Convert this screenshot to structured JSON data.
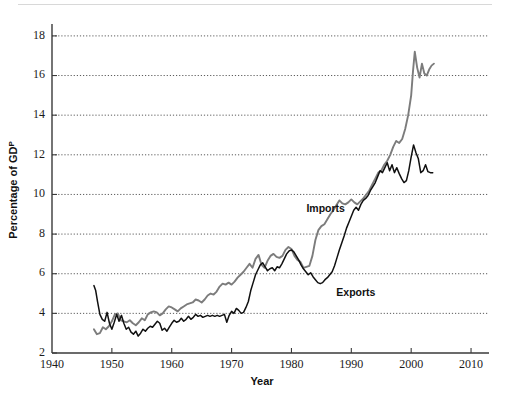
{
  "chart_data": {
    "type": "line",
    "title": "",
    "subtitle": "",
    "xlabel": "Year",
    "ylabel": "Percentage of GDP",
    "xlim": [
      1940,
      2013
    ],
    "ylim": [
      2,
      18.6
    ],
    "xticks": [
      1940,
      1950,
      1960,
      1970,
      1980,
      1990,
      2000,
      2010
    ],
    "yticks": [
      2,
      4,
      6,
      8,
      10,
      12,
      14,
      16,
      18
    ],
    "grid": "horizontal-dotted",
    "legend_position": "inline-annotations",
    "annotations": [
      {
        "text": "Imports",
        "x": 1982.5,
        "y": 9.1
      },
      {
        "text": "Exports",
        "x": 1987.5,
        "y": 4.9
      }
    ],
    "series": [
      {
        "name": "Imports",
        "color": "#7c7c7c",
        "x": [
          1947.0,
          1947.5,
          1948.0,
          1948.5,
          1949.0,
          1949.5,
          1950.0,
          1950.5,
          1951.0,
          1951.5,
          1952.0,
          1952.5,
          1953.0,
          1953.5,
          1954.0,
          1954.5,
          1955.0,
          1955.5,
          1956.0,
          1956.5,
          1957.0,
          1957.5,
          1958.0,
          1958.5,
          1959.0,
          1959.5,
          1960.0,
          1960.5,
          1961.0,
          1961.5,
          1962.0,
          1962.5,
          1963.0,
          1963.5,
          1964.0,
          1964.5,
          1965.0,
          1965.5,
          1966.0,
          1966.5,
          1967.0,
          1967.5,
          1968.0,
          1968.5,
          1969.0,
          1969.5,
          1970.0,
          1970.5,
          1971.0,
          1971.5,
          1972.0,
          1972.5,
          1973.0,
          1973.5,
          1974.0,
          1974.5,
          1975.0,
          1975.5,
          1976.0,
          1976.5,
          1977.0,
          1977.5,
          1978.0,
          1978.5,
          1979.0,
          1979.5,
          1980.0,
          1980.5,
          1981.0,
          1981.5,
          1982.0,
          1982.5,
          1983.0,
          1983.5,
          1984.0,
          1984.5,
          1985.0,
          1985.5,
          1986.0,
          1986.5,
          1987.0,
          1987.5,
          1988.0,
          1988.5,
          1989.0,
          1989.5,
          1990.0,
          1990.5,
          1991.0,
          1991.5,
          1992.0,
          1992.5,
          1993.0,
          1993.5,
          1994.0,
          1994.5,
          1995.0,
          1995.5,
          1996.0,
          1996.5,
          1997.0,
          1997.5,
          1998.0,
          1998.5,
          1999.0,
          1999.5,
          2000.0,
          2000.3,
          2000.6,
          2001.0,
          2001.4,
          2001.8,
          2002.2,
          2002.6,
          2003.0,
          2003.4,
          2003.8
        ],
        "y": [
          3.2,
          2.95,
          3.0,
          3.3,
          3.2,
          3.35,
          3.6,
          3.95,
          4.0,
          3.65,
          3.6,
          3.55,
          3.65,
          3.5,
          3.4,
          3.55,
          3.75,
          3.65,
          3.95,
          4.05,
          4.1,
          4.05,
          3.9,
          4.0,
          4.2,
          4.35,
          4.3,
          4.2,
          4.1,
          4.25,
          4.35,
          4.45,
          4.5,
          4.55,
          4.7,
          4.65,
          4.55,
          4.7,
          4.9,
          5.0,
          4.95,
          5.1,
          5.35,
          5.5,
          5.45,
          5.55,
          5.45,
          5.6,
          5.8,
          5.95,
          6.1,
          6.3,
          6.5,
          6.3,
          6.75,
          6.95,
          6.45,
          6.3,
          6.65,
          6.9,
          7.0,
          6.85,
          6.8,
          6.9,
          7.2,
          7.35,
          7.25,
          6.9,
          6.7,
          6.6,
          6.3,
          6.35,
          6.4,
          6.9,
          7.7,
          8.2,
          8.4,
          8.5,
          8.75,
          9.0,
          9.2,
          9.45,
          9.7,
          9.55,
          9.5,
          9.6,
          9.75,
          9.6,
          9.5,
          9.65,
          9.8,
          10.0,
          10.2,
          10.5,
          10.8,
          11.1,
          11.2,
          11.5,
          11.7,
          12.0,
          12.4,
          12.7,
          12.6,
          12.8,
          13.3,
          14.0,
          15.0,
          16.2,
          17.2,
          16.4,
          15.9,
          16.6,
          16.1,
          16.0,
          16.3,
          16.5,
          16.6
        ]
      },
      {
        "name": "Exports",
        "color": "#101010",
        "x": [
          1947.0,
          1947.3,
          1947.6,
          1948.0,
          1948.4,
          1948.8,
          1949.2,
          1949.6,
          1950.0,
          1950.4,
          1950.8,
          1951.2,
          1951.6,
          1952.0,
          1952.4,
          1952.8,
          1953.2,
          1953.6,
          1954.0,
          1954.4,
          1954.8,
          1955.2,
          1955.6,
          1956.0,
          1956.4,
          1956.8,
          1957.2,
          1957.6,
          1958.0,
          1958.4,
          1958.8,
          1959.2,
          1959.6,
          1960.0,
          1960.4,
          1960.8,
          1961.2,
          1961.6,
          1962.0,
          1962.4,
          1962.8,
          1963.2,
          1963.6,
          1964.0,
          1964.4,
          1964.8,
          1965.2,
          1965.6,
          1966.0,
          1966.4,
          1966.8,
          1967.2,
          1967.6,
          1968.0,
          1968.4,
          1968.8,
          1969.2,
          1969.6,
          1970.0,
          1970.4,
          1970.8,
          1971.2,
          1971.6,
          1972.0,
          1972.4,
          1972.8,
          1973.2,
          1973.6,
          1974.0,
          1974.4,
          1974.8,
          1975.2,
          1975.6,
          1976.0,
          1976.4,
          1976.8,
          1977.2,
          1977.6,
          1978.0,
          1978.4,
          1978.8,
          1979.2,
          1979.6,
          1980.0,
          1980.4,
          1980.8,
          1981.2,
          1981.6,
          1982.0,
          1982.4,
          1982.8,
          1983.2,
          1983.6,
          1984.0,
          1984.4,
          1984.8,
          1985.2,
          1985.6,
          1986.0,
          1986.4,
          1986.8,
          1987.2,
          1987.6,
          1988.0,
          1988.4,
          1988.8,
          1989.2,
          1989.6,
          1990.0,
          1990.4,
          1990.8,
          1991.2,
          1991.6,
          1992.0,
          1992.4,
          1992.8,
          1993.2,
          1993.6,
          1994.0,
          1994.4,
          1994.8,
          1995.2,
          1995.6,
          1996.0,
          1996.4,
          1996.8,
          1997.2,
          1997.6,
          1998.0,
          1998.4,
          1998.8,
          1999.2,
          1999.6,
          2000.0,
          2000.4,
          2000.8,
          2001.2,
          2001.6,
          2002.0,
          2002.4,
          2002.8,
          2003.2,
          2003.6
        ],
        "y": [
          5.4,
          5.15,
          4.6,
          3.95,
          3.7,
          3.6,
          4.05,
          3.5,
          3.2,
          3.55,
          3.95,
          3.6,
          3.9,
          3.5,
          3.2,
          3.3,
          3.05,
          2.95,
          3.1,
          2.85,
          3.0,
          3.2,
          3.1,
          3.25,
          3.35,
          3.3,
          3.45,
          3.6,
          3.5,
          3.15,
          3.25,
          3.1,
          3.3,
          3.5,
          3.65,
          3.55,
          3.6,
          3.75,
          3.6,
          3.7,
          3.85,
          3.7,
          3.8,
          3.95,
          3.85,
          3.9,
          3.8,
          3.85,
          3.9,
          3.85,
          3.9,
          3.85,
          3.9,
          3.85,
          3.9,
          3.95,
          3.55,
          3.9,
          4.1,
          4.0,
          4.25,
          4.15,
          4.0,
          4.05,
          4.3,
          4.6,
          5.15,
          5.55,
          5.95,
          6.2,
          6.45,
          6.55,
          6.35,
          6.15,
          6.25,
          6.3,
          6.15,
          6.35,
          6.3,
          6.5,
          6.75,
          7.0,
          7.15,
          7.2,
          7.1,
          6.9,
          6.7,
          6.45,
          6.25,
          6.1,
          5.95,
          6.05,
          5.85,
          5.7,
          5.55,
          5.5,
          5.55,
          5.7,
          5.8,
          5.95,
          6.1,
          6.4,
          6.8,
          7.2,
          7.55,
          7.9,
          8.3,
          8.6,
          8.9,
          9.2,
          9.35,
          9.2,
          9.5,
          9.7,
          9.8,
          9.95,
          10.2,
          10.4,
          10.6,
          10.9,
          11.2,
          11.1,
          11.35,
          11.6,
          11.2,
          11.5,
          11.1,
          11.35,
          11.05,
          10.8,
          10.6,
          10.7,
          11.2,
          11.9,
          12.5,
          12.1,
          11.8,
          11.1,
          11.2,
          11.5,
          11.15,
          11.1,
          11.1
        ]
      }
    ]
  },
  "axis": {
    "y_title_main": "Percentage of GD",
    "y_title_sup": "P",
    "x_title": "Year"
  }
}
